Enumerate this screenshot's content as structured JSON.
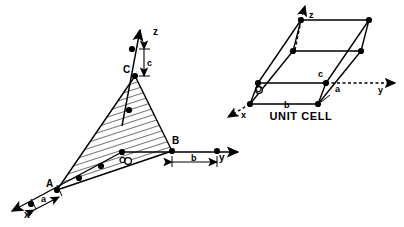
{
  "figure": {
    "title": "",
    "background_color": "#ffffff",
    "ink_color": "#000000"
  },
  "left_diagram": {
    "name": "intercept-plane-diagram",
    "axes": [
      {
        "id": "x",
        "label": "x",
        "direction": "lower-left",
        "style": "solid-arrow"
      },
      {
        "id": "y",
        "label": "y",
        "direction": "right",
        "style": "solid-arrow"
      },
      {
        "id": "z",
        "label": "z",
        "direction": "up",
        "style": "solid-arrow"
      }
    ],
    "vertices": [
      {
        "id": "A",
        "label": "A",
        "axis": "x"
      },
      {
        "id": "B",
        "label": "B",
        "axis": "y"
      },
      {
        "id": "C",
        "label": "C",
        "axis": "z"
      },
      {
        "id": "O",
        "label": "O",
        "axis": "origin"
      }
    ],
    "dimension_markers": [
      {
        "id": "a",
        "label": "a",
        "axis": "x"
      },
      {
        "id": "b",
        "label": "b",
        "axis": "y"
      },
      {
        "id": "c",
        "label": "c",
        "axis": "z"
      }
    ],
    "plane": {
      "fill": "hatched",
      "vertices": [
        "A",
        "B",
        "C"
      ]
    }
  },
  "right_diagram": {
    "name": "unit-cell-diagram",
    "caption": "UNIT CELL",
    "axes": [
      {
        "id": "x",
        "label": "x",
        "direction": "lower-left",
        "style": "dashed-arrow"
      },
      {
        "id": "y",
        "label": "y",
        "direction": "right",
        "style": "dashed-arrow"
      },
      {
        "id": "z",
        "label": "z",
        "direction": "up",
        "style": "dashed-arrow"
      }
    ],
    "edge_labels": [
      {
        "id": "a",
        "label": "a"
      },
      {
        "id": "b",
        "label": "b"
      },
      {
        "id": "c",
        "label": "c"
      }
    ],
    "origin": {
      "id": "O",
      "label": "O"
    }
  }
}
